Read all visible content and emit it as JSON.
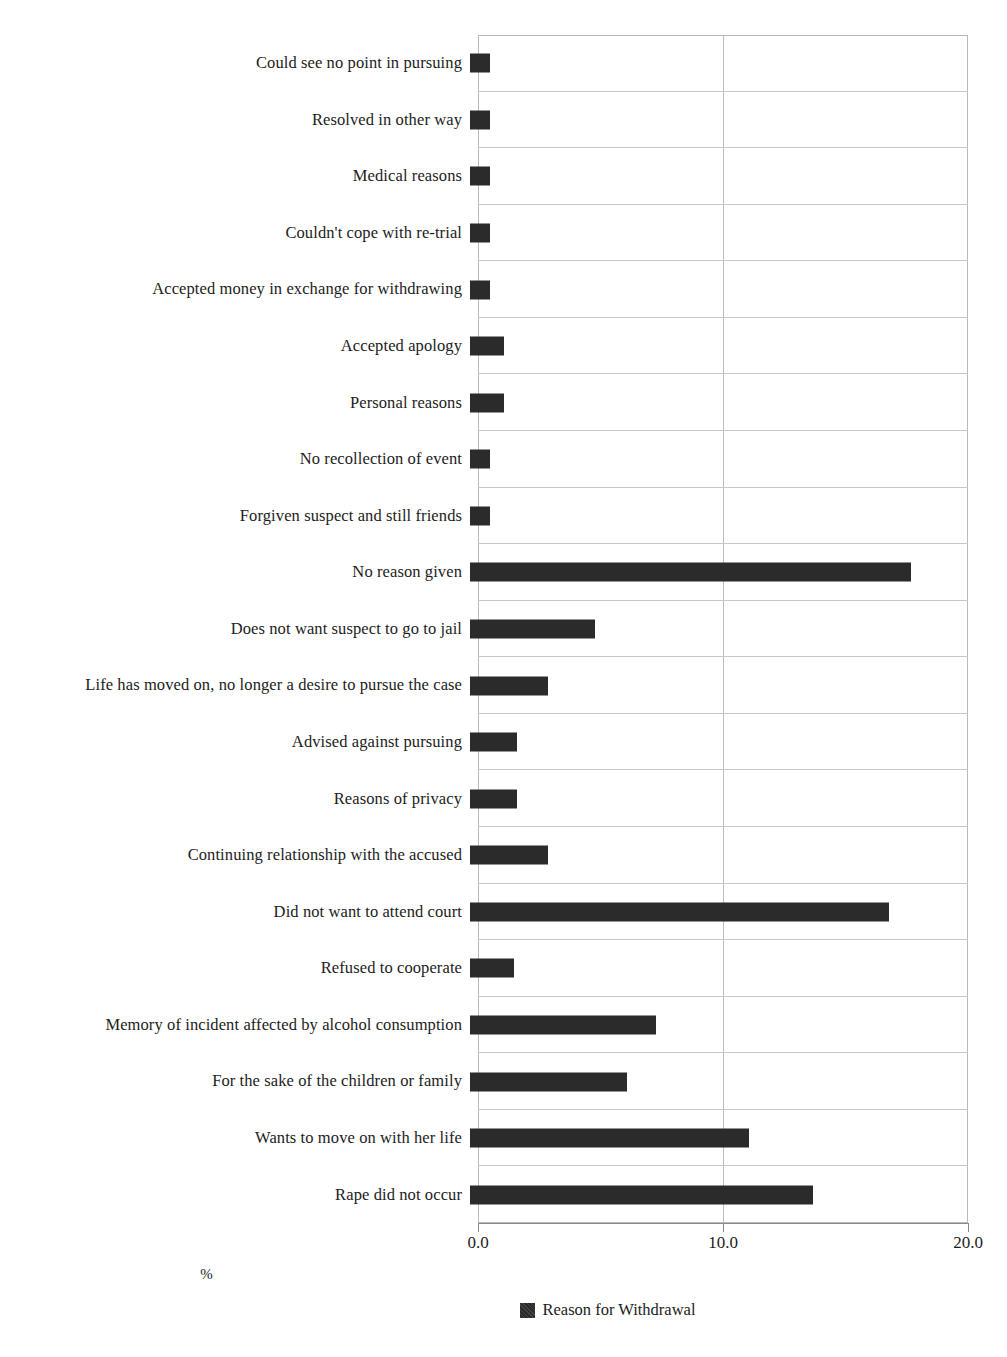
{
  "chart_data": {
    "type": "bar",
    "orientation": "horizontal",
    "title": "",
    "xlabel": "%",
    "ylabel": "",
    "xlim": [
      0.0,
      20.0
    ],
    "xticks": [
      "0.0",
      "10.0",
      "20.0"
    ],
    "xtick_values": [
      0.0,
      10.0,
      20.0
    ],
    "grid": true,
    "legend": [
      "Reason for Withdrawal"
    ],
    "legend_position": "bottom-center",
    "series_name": "Reason for Withdrawal",
    "bar_color": "#2b2b2b",
    "categories": [
      "Could see no point in pursuing",
      "Resolved in other way",
      "Medical reasons",
      "Couldn't cope with re-trial",
      "Accepted money in exchange for withdrawing",
      "Accepted apology",
      "Personal reasons",
      "No recollection of event",
      "Forgiven suspect and still friends",
      "No reason given",
      "Does not want suspect to go to jail",
      "Life has moved on, no longer a desire to pursue the case",
      "Advised against pursuing",
      "Reasons of privacy",
      "Continuing relationship with the accused",
      "Did not want to attend court",
      "Refused to cooperate",
      "Memory of incident affected by alcohol consumption",
      "For the sake of the children or family",
      "Wants to move on with her life",
      "Rape did not occur"
    ],
    "values": [
      0.8,
      0.8,
      0.8,
      0.8,
      0.8,
      1.4,
      1.4,
      0.8,
      0.8,
      18.0,
      5.1,
      3.2,
      1.9,
      1.9,
      3.2,
      17.1,
      1.8,
      7.6,
      6.4,
      11.4,
      14.0
    ]
  },
  "axis": {
    "x_title": "%",
    "tick_labels": [
      "0.0",
      "10.0",
      "20.0"
    ]
  },
  "legend": {
    "items": [
      {
        "label": "Reason for Withdrawal",
        "color": "#2b2b2b"
      }
    ]
  }
}
